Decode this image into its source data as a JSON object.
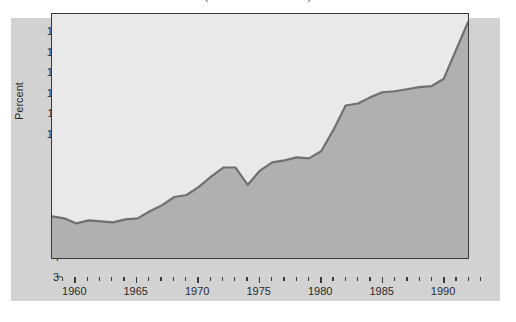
{
  "figure": {
    "title": "(1959 - 1993 Annual)",
    "panel_color": "#d2d2d2",
    "plot_background": "#e9e9e9",
    "area_fill_color": "#b0b0b0",
    "line_color": "#707070",
    "axis_color": "#3a3a3a"
  },
  "chart_data": {
    "type": "area",
    "title": "(1959 - 1993 Annual)",
    "xlabel": "",
    "ylabel": "Percent",
    "xlim": [
      1959,
      1993
    ],
    "ylim": [
      3,
      15
    ],
    "grid": false,
    "legend": null,
    "y_ticks": [
      3,
      4,
      5,
      6,
      7,
      8,
      9,
      10,
      11,
      12,
      13,
      14,
      15
    ],
    "x_ticks_major": [
      1960,
      1965,
      1970,
      1975,
      1980,
      1985,
      1990
    ],
    "x_ticks_minor_step": 1,
    "series": [
      {
        "name": "Percent",
        "x": [
          1959,
          1960,
          1961,
          1962,
          1963,
          1964,
          1965,
          1966,
          1967,
          1968,
          1969,
          1970,
          1971,
          1972,
          1973,
          1974,
          1975,
          1976,
          1977,
          1978,
          1979,
          1980,
          1981,
          1982,
          1983,
          1984,
          1985,
          1986,
          1987,
          1988,
          1989,
          1990,
          1991,
          1992,
          1993
        ],
        "values": [
          5.05,
          4.95,
          4.7,
          4.85,
          4.8,
          4.75,
          4.9,
          4.95,
          5.3,
          5.6,
          6.0,
          6.1,
          6.5,
          7.0,
          7.45,
          7.45,
          6.6,
          7.3,
          7.7,
          7.8,
          7.95,
          7.9,
          8.25,
          9.3,
          10.5,
          10.6,
          10.9,
          11.15,
          11.2,
          11.3,
          11.4,
          11.45,
          11.8,
          13.2,
          14.6
        ]
      }
    ]
  },
  "axis_labels": {
    "y": [
      "15",
      "14",
      "13",
      "12",
      "11",
      "10",
      "9",
      "8",
      "7",
      "6",
      "5",
      "4",
      "3"
    ],
    "y_title": "Percent",
    "x": [
      "1960",
      "1965",
      "1970",
      "1975",
      "1980",
      "1985",
      "1990"
    ]
  }
}
